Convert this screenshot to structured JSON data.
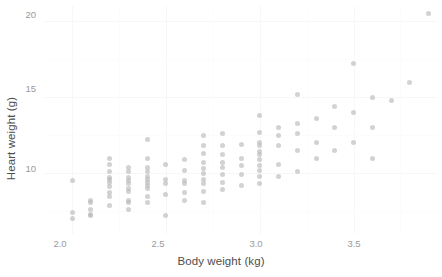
{
  "chart_data": {
    "type": "scatter",
    "title": "",
    "xlabel": "Body weight (kg)",
    "ylabel": "Heart weight (g)",
    "xlim": [
      1.85,
      3.95
    ],
    "ylim": [
      6.0,
      21.0
    ],
    "xticks": [
      "2.0",
      "2.5",
      "3.0",
      "3.5"
    ],
    "xtick_values": [
      2.0,
      2.5,
      3.0,
      3.5
    ],
    "yticks": [
      "10",
      "15",
      "20"
    ],
    "ytick_values": [
      10,
      15,
      20
    ],
    "grid": true,
    "legend": "none",
    "point_color": "#b6b6bb",
    "point_opacity": 0.62,
    "background_color": "#ffffff",
    "gridline_color": "#f7f7f7",
    "x": [
      2.0,
      2.0,
      2.0,
      2.1,
      2.1,
      2.1,
      2.1,
      2.1,
      2.2,
      2.2,
      2.2,
      2.2,
      2.2,
      2.2,
      2.2,
      2.2,
      2.2,
      2.2,
      2.3,
      2.3,
      2.3,
      2.3,
      2.3,
      2.3,
      2.3,
      2.3,
      2.3,
      2.3,
      2.4,
      2.4,
      2.4,
      2.4,
      2.4,
      2.4,
      2.4,
      2.4,
      2.4,
      2.4,
      2.4,
      2.5,
      2.5,
      2.5,
      2.5,
      2.5,
      2.6,
      2.6,
      2.6,
      2.6,
      2.6,
      2.6,
      2.7,
      2.7,
      2.7,
      2.7,
      2.7,
      2.7,
      2.7,
      2.7,
      2.7,
      2.7,
      2.8,
      2.8,
      2.8,
      2.8,
      2.8,
      2.8,
      2.8,
      2.8,
      2.9,
      2.9,
      2.9,
      2.9,
      2.9,
      3.0,
      3.0,
      3.0,
      3.0,
      3.0,
      3.0,
      3.0,
      3.0,
      3.0,
      3.0,
      3.0,
      3.1,
      3.1,
      3.1,
      3.1,
      3.1,
      3.2,
      3.2,
      3.2,
      3.2,
      3.2,
      3.3,
      3.3,
      3.3,
      3.4,
      3.4,
      3.4,
      3.5,
      3.5,
      3.5,
      3.6,
      3.6,
      3.6,
      3.7,
      3.8,
      3.9
    ],
    "y": [
      7.0,
      7.4,
      9.5,
      7.2,
      7.3,
      7.6,
      8.1,
      8.2,
      7.9,
      8.5,
      8.7,
      9.1,
      9.4,
      9.6,
      9.7,
      10.1,
      10.6,
      11.0,
      7.6,
      8.1,
      8.2,
      8.8,
      9.0,
      9.3,
      9.5,
      9.7,
      10.1,
      10.4,
      8.1,
      8.5,
      9.0,
      9.2,
      9.4,
      9.6,
      9.8,
      10.1,
      10.4,
      11.0,
      12.2,
      7.2,
      8.6,
      9.3,
      9.6,
      10.6,
      8.2,
      8.7,
      9.3,
      9.5,
      10.2,
      10.9,
      8.1,
      8.8,
      9.3,
      9.6,
      10.0,
      10.3,
      10.7,
      11.3,
      11.8,
      12.5,
      8.9,
      9.4,
      9.9,
      10.4,
      10.7,
      11.2,
      11.8,
      12.6,
      9.2,
      9.9,
      10.5,
      11.0,
      11.9,
      9.3,
      9.8,
      10.2,
      10.5,
      10.9,
      11.2,
      11.4,
      11.8,
      12.0,
      12.7,
      13.8,
      9.8,
      10.6,
      11.8,
      12.5,
      13.0,
      10.1,
      11.5,
      12.6,
      13.3,
      15.2,
      11.0,
      12.0,
      13.6,
      11.5,
      13.0,
      14.4,
      12.0,
      14.0,
      17.2,
      11.0,
      13.0,
      15.0,
      14.8,
      16.0,
      20.5
    ]
  },
  "axes": {
    "x_title": "Body weight (kg)",
    "y_title": "Heart weight (g)",
    "x_tick_labels": [
      "2.0",
      "2.5",
      "3.0",
      "3.5"
    ],
    "y_tick_labels": [
      "10",
      "15",
      "20"
    ]
  }
}
